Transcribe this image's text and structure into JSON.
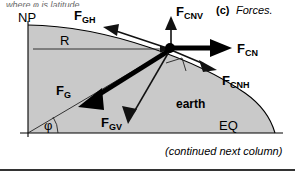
{
  "figure": {
    "clipped_header_text": "where φ is latitude.",
    "panel_tag": "(c)",
    "panel_title": "Forces.",
    "caption": "(continued next column)",
    "body_label": "earth",
    "colors": {
      "earth_fill": "#c9c9c9",
      "stroke": "#000000",
      "thin_stroke": "#1a1a1a",
      "background": "#ffffff",
      "rule": "#333333"
    },
    "axes": {
      "north_pole_label": "NP",
      "equator_label": "EQ",
      "radius_label": "R",
      "latitude_symbol": "φ"
    },
    "forces": [
      {
        "id": "FGH",
        "base": "F",
        "sub": "GH",
        "direction": "up-left",
        "weight": "thin",
        "description": "gravity horizontal component"
      },
      {
        "id": "FG",
        "base": "F",
        "sub": "G",
        "direction": "down-left",
        "weight": "thick",
        "description": "gravity total"
      },
      {
        "id": "FGV",
        "base": "F",
        "sub": "GV",
        "direction": "down-right",
        "weight": "thin",
        "description": "gravity vertical component"
      },
      {
        "id": "FCNV",
        "base": "F",
        "sub": "CNV",
        "direction": "up",
        "weight": "thin",
        "description": "centrifugal vertical component"
      },
      {
        "id": "FCN",
        "base": "F",
        "sub": "CN",
        "direction": "right",
        "weight": "thick",
        "description": "centrifugal total"
      },
      {
        "id": "FCNH",
        "base": "F",
        "sub": "CNH",
        "direction": "right-down",
        "weight": "thin",
        "description": "centrifugal horizontal component"
      }
    ]
  }
}
